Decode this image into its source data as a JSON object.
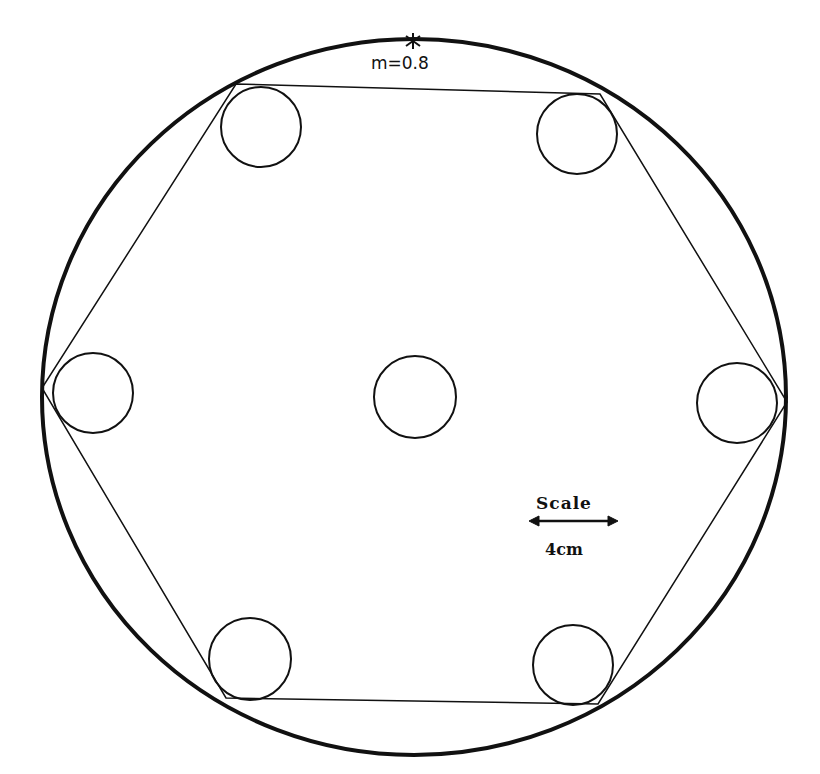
{
  "diagram": {
    "marker_label": "m=0.8",
    "scale": {
      "title": "Scale",
      "value": "4cm"
    },
    "outer_circle": {
      "cx": 414,
      "cy": 397,
      "rx": 372,
      "ry": 358
    },
    "hexagon_vertices": [
      [
        236,
        84
      ],
      [
        600,
        94
      ],
      [
        787,
        402
      ],
      [
        598,
        704
      ],
      [
        226,
        698
      ],
      [
        42,
        388
      ]
    ],
    "small_circles": [
      {
        "name": "top-left",
        "cx": 261,
        "cy": 127,
        "r": 40
      },
      {
        "name": "top-right",
        "cx": 577,
        "cy": 134,
        "r": 40
      },
      {
        "name": "left",
        "cx": 93,
        "cy": 393,
        "r": 40
      },
      {
        "name": "center",
        "cx": 415,
        "cy": 397,
        "r": 41
      },
      {
        "name": "right",
        "cx": 737,
        "cy": 403,
        "r": 40
      },
      {
        "name": "bottom-left",
        "cx": 250,
        "cy": 659,
        "r": 41
      },
      {
        "name": "bottom-right",
        "cx": 573,
        "cy": 665,
        "r": 40
      }
    ],
    "colors": {
      "stroke": "#111111",
      "background": "#ffffff"
    }
  }
}
